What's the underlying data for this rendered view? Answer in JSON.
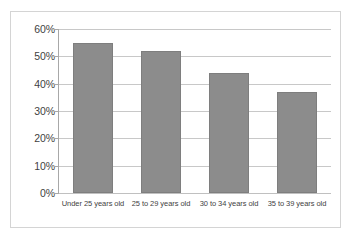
{
  "chart_data": {
    "type": "bar",
    "title": "",
    "subtitle": "",
    "xlabel": "",
    "ylabel": "",
    "categories": [
      "Under 25 years old",
      "25 to 29 years old",
      "30 to 34 years old",
      "35 to 39 years old"
    ],
    "values": [
      55,
      52,
      44,
      37
    ],
    "value_labels": [
      "55%",
      "52%",
      "44%",
      "37%"
    ],
    "ylim": [
      0,
      60
    ],
    "y_ticks": [
      0,
      10,
      20,
      30,
      40,
      50,
      60
    ],
    "y_tick_labels": [
      "0%",
      "10%",
      "20%",
      "30%",
      "40%",
      "50%",
      "60%"
    ],
    "grid": true,
    "legend": false,
    "legend_position": "none",
    "colors": {
      "bar_fill": "#8c8c8c",
      "bar_border": "#7e7e7e",
      "gridline": "#c8c8c8",
      "axis_line": "#a8a8a8",
      "frame_border": "#d4d4d4",
      "background": "#ffffff",
      "tick_text": "#3f3f3f"
    }
  }
}
